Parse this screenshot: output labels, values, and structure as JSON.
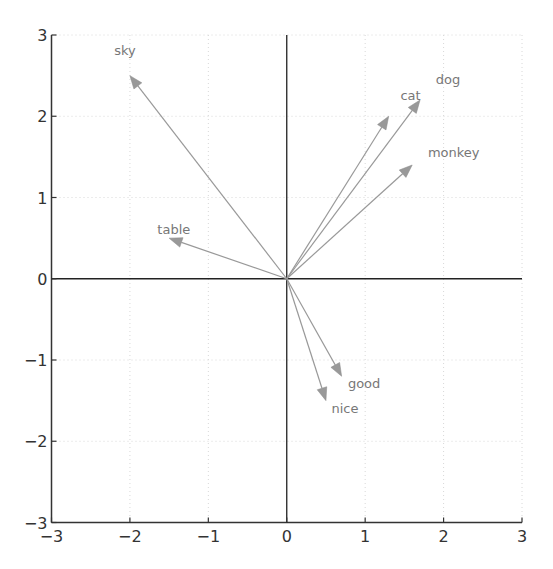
{
  "chart_data": {
    "type": "scatter",
    "subtype": "vector-quiver",
    "title": "",
    "xlabel": "",
    "ylabel": "",
    "xlim": [
      -3,
      3
    ],
    "ylim": [
      -3,
      3
    ],
    "grid": true,
    "x_ticks": [
      -3,
      -2,
      -1,
      0,
      1,
      2,
      3
    ],
    "y_ticks": [
      -3,
      -2,
      -1,
      0,
      1,
      2,
      3
    ],
    "x_tick_labels": [
      "−3",
      "−2",
      "−1",
      "0",
      "1",
      "2",
      "3"
    ],
    "y_tick_labels": [
      "−3",
      "−2",
      "−1",
      "0",
      "1",
      "2",
      "3"
    ],
    "origin": [
      0,
      0
    ],
    "vectors": [
      {
        "name": "sky",
        "x": -2.0,
        "y": 2.5,
        "label_pos": [
          -2.2,
          2.75
        ]
      },
      {
        "name": "table",
        "x": -1.5,
        "y": 0.5,
        "label_pos": [
          -1.65,
          0.55
        ]
      },
      {
        "name": "cat",
        "x": 1.3,
        "y": 2.0,
        "label_pos": [
          1.45,
          2.2
        ]
      },
      {
        "name": "dog",
        "x": 1.7,
        "y": 2.2,
        "label_pos": [
          1.9,
          2.4
        ]
      },
      {
        "name": "monkey",
        "x": 1.6,
        "y": 1.4,
        "label_pos": [
          1.8,
          1.5
        ]
      },
      {
        "name": "good",
        "x": 0.7,
        "y": -1.2,
        "label_pos": [
          0.78,
          -1.35
        ]
      },
      {
        "name": "nice",
        "x": 0.5,
        "y": -1.5,
        "label_pos": [
          0.57,
          -1.65
        ]
      }
    ],
    "colors": {
      "vector": "#999999",
      "label": "#777777",
      "axis": "#333333"
    }
  }
}
